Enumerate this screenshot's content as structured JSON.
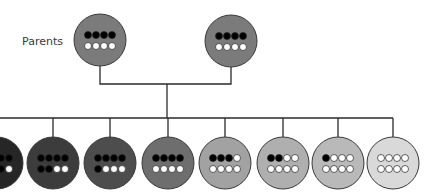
{
  "title": "",
  "labels": {
    "parents": "Parents"
  },
  "line_color": "#2a2a2a",
  "allele_colors": {
    "dark": "#000000",
    "light": "#ffffff"
  },
  "parents": [
    {
      "id": "parent-1",
      "cx": 100,
      "cy": 40,
      "dark_alleles": 4,
      "fill": "#7b7b7b"
    },
    {
      "id": "parent-2",
      "cx": 231,
      "cy": 41,
      "dark_alleles": 4,
      "fill": "#7b7b7b"
    }
  ],
  "offspring": [
    {
      "id": "offspring-1",
      "cx": -3,
      "cy": 163,
      "dark_alleles": 7,
      "fill": "#262626"
    },
    {
      "id": "offspring-2",
      "cx": 53,
      "cy": 163,
      "dark_alleles": 6,
      "fill": "#3c3c3c"
    },
    {
      "id": "offspring-3",
      "cx": 110,
      "cy": 163,
      "dark_alleles": 5,
      "fill": "#4d4d4d"
    },
    {
      "id": "offspring-4",
      "cx": 168,
      "cy": 163,
      "dark_alleles": 4,
      "fill": "#6e6e6e"
    },
    {
      "id": "offspring-5",
      "cx": 225,
      "cy": 163,
      "dark_alleles": 3,
      "fill": "#a2a2a2"
    },
    {
      "id": "offspring-6",
      "cx": 283,
      "cy": 163,
      "dark_alleles": 2,
      "fill": "#afafaf"
    },
    {
      "id": "offspring-7",
      "cx": 338,
      "cy": 163,
      "dark_alleles": 1,
      "fill": "#b9b9b9"
    },
    {
      "id": "offspring-8",
      "cx": 393,
      "cy": 163,
      "dark_alleles": 0,
      "fill": "#d9d9d9"
    }
  ],
  "alleles_per_individual": 8,
  "connectors": {
    "parents_bar_y": 84,
    "offspring_bar_y": 118,
    "center_x": 167
  }
}
